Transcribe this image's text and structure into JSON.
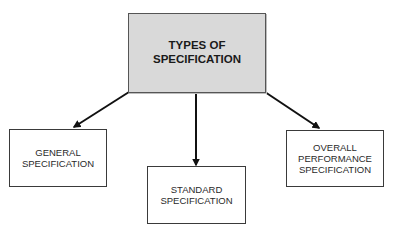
{
  "diagram": {
    "type": "hierarchy",
    "root": {
      "id": "types-of-specification",
      "lines": [
        "TYPES OF",
        "SPECIFICATION"
      ],
      "fill": "#d9d9d9"
    },
    "children": [
      {
        "id": "general-specification",
        "lines": [
          "GENERAL",
          "SPECIFICATION"
        ]
      },
      {
        "id": "standard-specification",
        "lines": [
          "STANDARD",
          "SPECIFICATION"
        ]
      },
      {
        "id": "overall-performance-specification",
        "lines": [
          "OVERALL",
          "PERFORMANCE",
          "SPECIFICATION"
        ]
      }
    ],
    "edges": [
      {
        "from": "types-of-specification",
        "to": "general-specification"
      },
      {
        "from": "types-of-specification",
        "to": "standard-specification"
      },
      {
        "from": "types-of-specification",
        "to": "overall-performance-specification"
      }
    ],
    "colors": {
      "arrow": "#111111",
      "border": "#3a3a3a",
      "root_fill": "#d9d9d9"
    }
  }
}
